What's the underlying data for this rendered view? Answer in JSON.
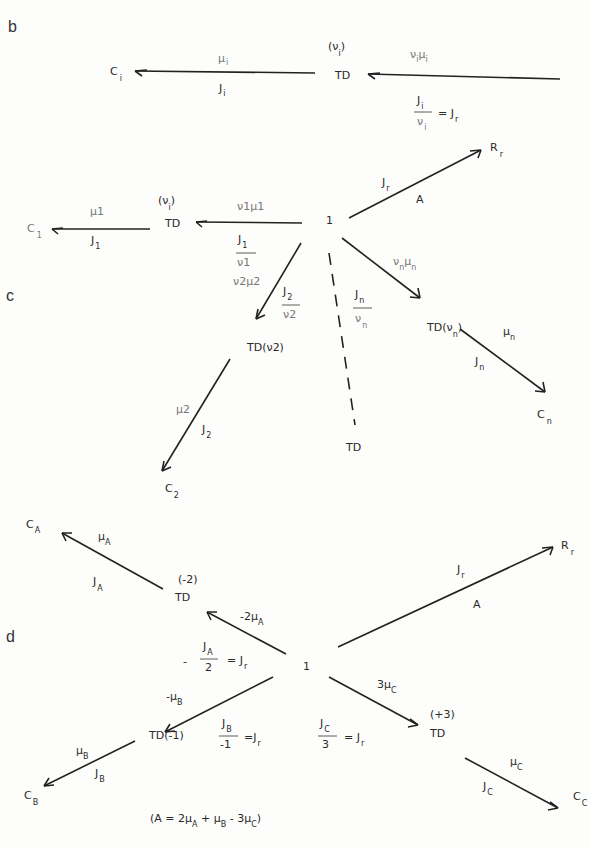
{
  "panels": {
    "b": "b",
    "c": "c",
    "d": "d"
  },
  "b": {
    "Ci": [
      "C",
      "i"
    ],
    "TD": "TD",
    "nu_i_label": [
      "(ν",
      "i",
      ")"
    ],
    "mu_i": [
      "μ",
      "i"
    ],
    "J_i": [
      "J",
      "i"
    ],
    "nu_mu": [
      "ν",
      "i",
      "μ",
      "i"
    ],
    "eq_num": [
      "J",
      "i"
    ],
    "eq_den": [
      "ν",
      "i"
    ],
    "eq_rhs": [
      "= J",
      "r"
    ]
  },
  "c": {
    "C1": [
      "C",
      "1"
    ],
    "TD1": "TD",
    "TD1_param": [
      "(ν",
      "i",
      ")"
    ],
    "mu1": "μ1",
    "J1": [
      "J",
      "1"
    ],
    "nu1mu1": "ν1μ1",
    "J1_frac_num": [
      "J",
      "1"
    ],
    "J1_frac_den": "ν1",
    "one": "1",
    "Jr": [
      "J",
      "r"
    ],
    "A": "A",
    "Rr": [
      "R",
      "r"
    ],
    "nu2mu2": "ν2μ2",
    "J2_frac_num": [
      "J",
      "2"
    ],
    "J2_frac_den": "ν2",
    "TD2": "TD(ν2)",
    "mu2": "μ2",
    "J2": [
      "J",
      "2"
    ],
    "C2": [
      "C",
      "2"
    ],
    "Jn_frac_num": [
      "J",
      "n"
    ],
    "Jn_frac_den": [
      "ν",
      "n"
    ],
    "TD_dashed": "TD",
    "nunmun": [
      "ν",
      "n",
      "μ",
      "n"
    ],
    "TDn": [
      "TD(ν",
      "n",
      ")"
    ],
    "mun": [
      "μ",
      "n"
    ],
    "Jn": [
      "J",
      "n"
    ],
    "Cn": [
      "C",
      "n"
    ]
  },
  "d": {
    "CA": [
      "C",
      "A"
    ],
    "muA": [
      "μ",
      "A"
    ],
    "JA": [
      "J",
      "A"
    ],
    "TDA_param": "(-2)",
    "TDA": "TD",
    "neg2muA": [
      "-2μ",
      "A"
    ],
    "eqA_minus": "-",
    "eqA_num": [
      "J",
      "A"
    ],
    "eqA_den": "2",
    "eqA_rhs": [
      "= J",
      "r"
    ],
    "one": "1",
    "Jr": [
      "J",
      "r"
    ],
    "A": "A",
    "Rr": [
      "R",
      "r"
    ],
    "negmuB": [
      "-μ",
      "B"
    ],
    "TDB": "TD(-1)",
    "eqB_num": [
      "J",
      "B"
    ],
    "eqB_den": "-1",
    "eqB_rhs": [
      "=J",
      "r"
    ],
    "muB": [
      "μ",
      "B"
    ],
    "JB": [
      "J",
      "B"
    ],
    "CB": [
      "C",
      "B"
    ],
    "threemuC": [
      "3μ",
      "C"
    ],
    "eqC_num": [
      "J",
      "C"
    ],
    "eqC_den": "3",
    "eqC_rhs": [
      "= J",
      "r"
    ],
    "TDC_param": "(+3)",
    "TDC": "TD",
    "muC": [
      "μ",
      "C"
    ],
    "JC": [
      "J",
      "C"
    ],
    "CC": [
      "C",
      "C"
    ],
    "affinity_eq": [
      "(A = 2μ",
      "A",
      " + μ",
      "B",
      " - 3μ",
      "C",
      ")"
    ]
  }
}
